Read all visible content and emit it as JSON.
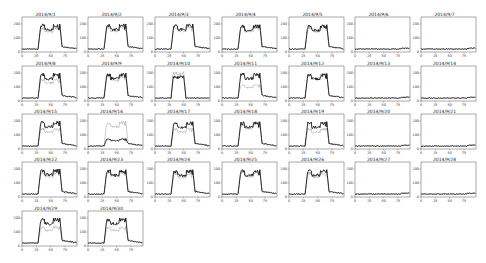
{
  "chart_data": {
    "type": "line",
    "title": "",
    "layout": {
      "rows": 5,
      "cols": 7,
      "legend": "none",
      "grid": false
    },
    "xticks": [
      0,
      25,
      50,
      75
    ],
    "yticks": [
      0,
      100,
      200
    ],
    "xlim": [
      0,
      96
    ],
    "ylim": [
      0,
      250
    ],
    "series_names": [
      "actual (black)",
      "predicted (gray)"
    ],
    "panels": [
      {
        "date": "2014/9/1",
        "profile": "work",
        "peak_black": 200,
        "peak_gray": 180
      },
      {
        "date": "2014/9/2",
        "profile": "work",
        "peak_black": 200,
        "peak_gray": 185
      },
      {
        "date": "2014/9/3",
        "profile": "work",
        "peak_black": 200,
        "peak_gray": 185
      },
      {
        "date": "2014/9/4",
        "profile": "work",
        "peak_black": 195,
        "peak_gray": 185
      },
      {
        "date": "2014/9/5",
        "profile": "work",
        "peak_black": 195,
        "peak_gray": 185
      },
      {
        "date": "2014/9/6",
        "profile": "flat",
        "peak_black": 20,
        "peak_gray": 20
      },
      {
        "date": "2014/9/7",
        "profile": "flat",
        "peak_black": 20,
        "peak_gray": 20
      },
      {
        "date": "2014/9/8",
        "profile": "work",
        "peak_black": 200,
        "peak_gray": 160
      },
      {
        "date": "2014/9/9",
        "profile": "work",
        "peak_black": 200,
        "peak_gray": 185
      },
      {
        "date": "2014/9/10",
        "profile": "halfday",
        "peak_black": 180,
        "peak_gray": 210
      },
      {
        "date": "2014/9/11",
        "profile": "work",
        "peak_black": 200,
        "peak_gray": 120
      },
      {
        "date": "2014/9/12",
        "profile": "work",
        "peak_black": 195,
        "peak_gray": 200
      },
      {
        "date": "2014/9/13",
        "profile": "flat",
        "peak_black": 20,
        "peak_gray": 20
      },
      {
        "date": "2014/9/14",
        "profile": "flat",
        "peak_black": 20,
        "peak_gray": 20
      },
      {
        "date": "2014/9/15",
        "profile": "work",
        "peak_black": 200,
        "peak_gray": 150
      },
      {
        "date": "2014/9/16",
        "profile": "low",
        "peak_black": 75,
        "peak_gray": 200
      },
      {
        "date": "2014/9/17",
        "profile": "work",
        "peak_black": 195,
        "peak_gray": 150
      },
      {
        "date": "2014/9/18",
        "profile": "work",
        "peak_black": 195,
        "peak_gray": 185
      },
      {
        "date": "2014/9/19",
        "profile": "work",
        "peak_black": 195,
        "peak_gray": 150
      },
      {
        "date": "2014/9/20",
        "profile": "flat",
        "peak_black": 20,
        "peak_gray": 25
      },
      {
        "date": "2014/9/21",
        "profile": "flat",
        "peak_black": 20,
        "peak_gray": 20
      },
      {
        "date": "2014/9/22",
        "profile": "work",
        "peak_black": 200,
        "peak_gray": 185
      },
      {
        "date": "2014/9/23",
        "profile": "work",
        "peak_black": 195,
        "peak_gray": 185
      },
      {
        "date": "2014/9/24",
        "profile": "work",
        "peak_black": 195,
        "peak_gray": 175
      },
      {
        "date": "2014/9/25",
        "profile": "work",
        "peak_black": 195,
        "peak_gray": 185
      },
      {
        "date": "2014/9/26",
        "profile": "work",
        "peak_black": 195,
        "peak_gray": 180
      },
      {
        "date": "2014/9/27",
        "profile": "flat",
        "peak_black": 20,
        "peak_gray": 25
      },
      {
        "date": "2014/9/28",
        "profile": "flat",
        "peak_black": 20,
        "peak_gray": 20
      },
      {
        "date": "2014/9/29",
        "profile": "work",
        "peak_black": 200,
        "peak_gray": 140
      },
      {
        "date": "2014/9/30",
        "profile": "work",
        "peak_black": 200,
        "peak_gray": 140
      }
    ]
  }
}
